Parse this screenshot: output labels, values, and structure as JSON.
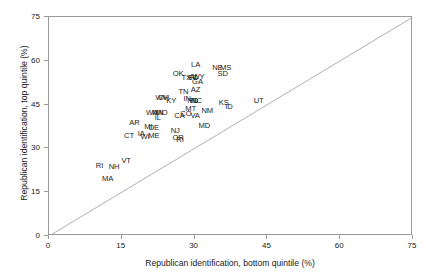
{
  "chart_data": {
    "type": "scatter",
    "title": "",
    "xlabel": "Republican identification, bottom quintile (%)",
    "ylabel": "Republican identification, top quintile (%)",
    "xlim": [
      0,
      75
    ],
    "ylim": [
      0,
      75
    ],
    "xticks": [
      0,
      15,
      30,
      45,
      60,
      75
    ],
    "yticks": [
      0,
      15,
      30,
      45,
      60,
      75
    ],
    "xticklabels": [
      "0",
      "15",
      "30",
      "45",
      "60",
      "75"
    ],
    "yticklabels": [
      "0",
      "15",
      "30",
      "45",
      "60",
      "75"
    ],
    "grid": false,
    "legend": null,
    "marker_style": "text-label",
    "annotations": [
      {
        "type": "line",
        "name": "identity-line",
        "description": "45-degree y = x reference line",
        "from": [
          0,
          0
        ],
        "to": [
          75,
          75
        ],
        "color": "#b0b0b0"
      }
    ],
    "points": [
      {
        "label": "LA",
        "x": 30.2,
        "y": 58.6
      },
      {
        "label": "NE",
        "x": 34.7,
        "y": 57.6
      },
      {
        "label": "MS",
        "x": 36.4,
        "y": 57.6
      },
      {
        "label": "SD",
        "x": 35.8,
        "y": 55.4
      },
      {
        "label": "OK",
        "x": 26.6,
        "y": 55.6
      },
      {
        "label": "TX",
        "x": 28.3,
        "y": 54.2
      },
      {
        "label": "SC",
        "x": 29.6,
        "y": 54.0
      },
      {
        "label": "AL",
        "x": 29.9,
        "y": 54.3
      },
      {
        "label": "WY",
        "x": 30.8,
        "y": 54.5
      },
      {
        "label": "GA",
        "x": 30.6,
        "y": 52.8
      },
      {
        "label": "AZ",
        "x": 30.2,
        "y": 50.1
      },
      {
        "label": "TN",
        "x": 27.7,
        "y": 49.2
      },
      {
        "label": "WV",
        "x": 23.2,
        "y": 47.3
      },
      {
        "label": "OH",
        "x": 23.6,
        "y": 47.2
      },
      {
        "label": "KY",
        "x": 25.2,
        "y": 46.4
      },
      {
        "label": "IN",
        "x": 28.5,
        "y": 47.0
      },
      {
        "label": "ND",
        "x": 29.6,
        "y": 46.4
      },
      {
        "label": "NC",
        "x": 30.4,
        "y": 46.3
      },
      {
        "label": "FL",
        "x": 29.9,
        "y": 46.4
      },
      {
        "label": "KS",
        "x": 36.0,
        "y": 45.6
      },
      {
        "label": "UT",
        "x": 43.2,
        "y": 46.1
      },
      {
        "label": "ID",
        "x": 37.1,
        "y": 44.1
      },
      {
        "label": "MT",
        "x": 29.2,
        "y": 43.6
      },
      {
        "label": "NM",
        "x": 32.6,
        "y": 42.9
      },
      {
        "label": "WA",
        "x": 21.2,
        "y": 42.0
      },
      {
        "label": "MN",
        "x": 22.4,
        "y": 42.2
      },
      {
        "label": "MO",
        "x": 23.2,
        "y": 42.2
      },
      {
        "label": "CA",
        "x": 26.9,
        "y": 41.2
      },
      {
        "label": "CO",
        "x": 28.2,
        "y": 41.7
      },
      {
        "label": "VA",
        "x": 30.1,
        "y": 41.0
      },
      {
        "label": "IL",
        "x": 22.4,
        "y": 40.4
      },
      {
        "label": "AR",
        "x": 17.6,
        "y": 38.8
      },
      {
        "label": "MD",
        "x": 32.0,
        "y": 37.8
      },
      {
        "label": "MI",
        "x": 20.5,
        "y": 37.2
      },
      {
        "label": "DE",
        "x": 21.6,
        "y": 37.1
      },
      {
        "label": "NJ",
        "x": 26.0,
        "y": 36.1
      },
      {
        "label": "CT",
        "x": 16.5,
        "y": 34.1
      },
      {
        "label": "IA",
        "x": 19.0,
        "y": 34.8
      },
      {
        "label": "WI",
        "x": 19.8,
        "y": 33.9
      },
      {
        "label": "ME",
        "x": 21.6,
        "y": 34.1
      },
      {
        "label": "OR",
        "x": 26.6,
        "y": 33.6
      },
      {
        "label": "RI",
        "x": 27.0,
        "y": 33.0
      },
      {
        "label": "VT",
        "x": 15.9,
        "y": 25.8
      },
      {
        "label": "NH",
        "x": 13.4,
        "y": 23.8
      },
      {
        "label": "RI",
        "x": 10.4,
        "y": 24.1
      },
      {
        "label": "MA",
        "x": 12.1,
        "y": 19.4
      }
    ]
  }
}
